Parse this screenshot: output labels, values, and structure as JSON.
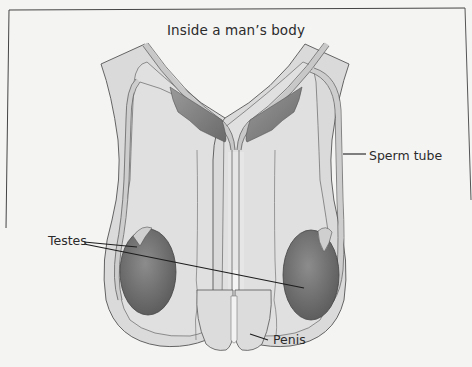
{
  "diagram": {
    "title": "Inside a man’s body",
    "labels": {
      "sperm_tube": "Sperm tube",
      "testes": "Testes",
      "penis": "Penis"
    },
    "colors": {
      "background": "#f4f4f3",
      "body_fill": "#d9d9d9",
      "outline": "#555555",
      "tube_fill": "#c9c9c9",
      "gland_fill": "#8a8a8a",
      "testis_fill": "#6f6f6f",
      "leader_line": "#1e1e1e"
    }
  }
}
